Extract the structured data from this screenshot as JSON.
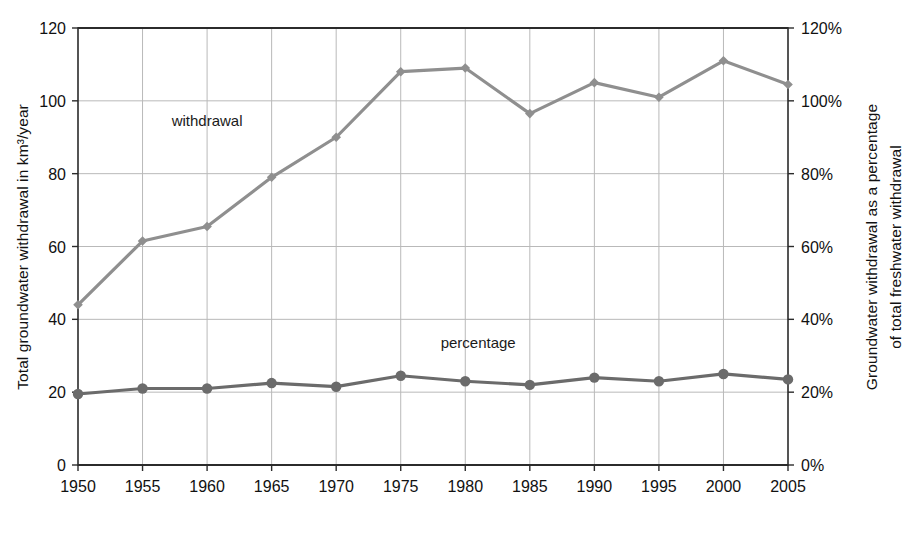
{
  "chart_data": {
    "type": "line",
    "title": "",
    "xlabel": "",
    "ylabel": "Total groundwater withdrawal in km³/year",
    "y2label_line1": "Groundwater withdrawal as a percentage",
    "y2label_line2": "of total freshwater withdrawal",
    "categories": [
      "1950",
      "1955",
      "1960",
      "1965",
      "1970",
      "1975",
      "1980",
      "1985",
      "1990",
      "1995",
      "2000",
      "2005"
    ],
    "x": [
      1950,
      1955,
      1960,
      1965,
      1970,
      1975,
      1980,
      1985,
      1990,
      1995,
      2000,
      2005
    ],
    "ylim": [
      0,
      120
    ],
    "y2lim": [
      0,
      120
    ],
    "yticks": [
      "0",
      "20",
      "40",
      "60",
      "80",
      "100",
      "120"
    ],
    "ytick_values": [
      0,
      20,
      40,
      60,
      80,
      100,
      120
    ],
    "y2ticks": [
      "0%",
      "20%",
      "40%",
      "60%",
      "80%",
      "100%",
      "120%"
    ],
    "y2tick_values": [
      0,
      20,
      40,
      60,
      80,
      100,
      120
    ],
    "grid": true,
    "legend": "inline-annotations",
    "series": [
      {
        "name": "withdrawal",
        "axis": "left",
        "unit": "km³/year",
        "color": "#8f8f8f",
        "marker": "diamond",
        "annotation": "withdrawal",
        "values": [
          44,
          61.5,
          65.5,
          79,
          90,
          108,
          109,
          96.5,
          105,
          101,
          111,
          104.5
        ]
      },
      {
        "name": "percentage",
        "axis": "right",
        "unit": "%",
        "color": "#6b6b6b",
        "marker": "circle",
        "annotation": "percentage",
        "values": [
          19.5,
          21,
          21,
          22.5,
          21.5,
          24.5,
          23,
          22,
          24,
          23,
          25,
          23.5
        ]
      }
    ],
    "annotations": [
      {
        "text": "withdrawal",
        "x": 1960,
        "y": 93
      },
      {
        "text": "percentage",
        "x": 1981,
        "y": 32
      }
    ]
  },
  "colors": {
    "withdrawal_line": "#8f8f8f",
    "percentage_line": "#6b6b6b",
    "gridline": "#b9b9b9",
    "frame": "#2b2b2b",
    "background": "#ffffff",
    "text": "#111111"
  }
}
